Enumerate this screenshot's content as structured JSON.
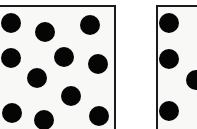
{
  "figure": {
    "canvas": {
      "width": 197,
      "height": 129,
      "background": "#ffffff"
    },
    "colors": {
      "dot": "#050505",
      "panel_border": "#1b1b1b",
      "panel_fill": "#f8f8f6",
      "page_background": "#ffffff"
    }
  },
  "chart_data": {
    "type": "scatter",
    "title": "",
    "subtitle": "",
    "xlabel": "",
    "ylabel": "",
    "grid": false,
    "legend": null,
    "axis_visible": false,
    "tick_labels": [],
    "annotations": [],
    "xlim": [
      0,
      197
    ],
    "ylim": [
      0,
      129
    ],
    "marker": {
      "shape": "circle",
      "color": "#050505",
      "radius_px": 10
    },
    "panels": [
      {
        "name": "left-panel",
        "label": "",
        "bounds": {
          "x": -8,
          "y": 5,
          "width": 124,
          "height": 140
        },
        "border_width": 2,
        "clipped_edges": [
          "left",
          "bottom"
        ],
        "dot_count_visible": 12,
        "dots": [
          {
            "x": 11,
            "y": 23,
            "r": 10
          },
          {
            "x": 45,
            "y": 32,
            "r": 10
          },
          {
            "x": 90,
            "y": 25,
            "r": 10
          },
          {
            "x": 11,
            "y": 58,
            "r": 10
          },
          {
            "x": 64,
            "y": 57,
            "r": 10
          },
          {
            "x": 98,
            "y": 64,
            "r": 10
          },
          {
            "x": 37,
            "y": 78,
            "r": 10
          },
          {
            "x": 71,
            "y": 96,
            "r": 10
          },
          {
            "x": 12,
            "y": 113,
            "r": 10
          },
          {
            "x": 44,
            "y": 120,
            "r": 10
          },
          {
            "x": 99,
            "y": 116,
            "r": 10
          }
        ]
      },
      {
        "name": "right-panel",
        "label": "",
        "bounds": {
          "x": 156,
          "y": 5,
          "width": 50,
          "height": 140
        },
        "border_width": 2,
        "clipped_edges": [
          "right",
          "bottom"
        ],
        "dot_count_visible": 4,
        "dots": [
          {
            "x": 169,
            "y": 23,
            "r": 10
          },
          {
            "x": 169,
            "y": 59,
            "r": 10
          },
          {
            "x": 196,
            "y": 80,
            "r": 10
          },
          {
            "x": 169,
            "y": 111,
            "r": 10
          }
        ]
      }
    ]
  }
}
